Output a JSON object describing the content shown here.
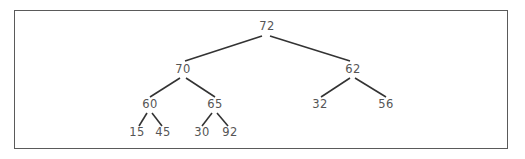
{
  "diagram": {
    "type": "binary-tree",
    "nodes": [
      {
        "id": "n72",
        "label": "72",
        "x": 267,
        "y": 27
      },
      {
        "id": "n70",
        "label": "70",
        "x": 183,
        "y": 70
      },
      {
        "id": "n62",
        "label": "62",
        "x": 353,
        "y": 70
      },
      {
        "id": "n60",
        "label": "60",
        "x": 150,
        "y": 105
      },
      {
        "id": "n65",
        "label": "65",
        "x": 215,
        "y": 105
      },
      {
        "id": "n32",
        "label": "32",
        "x": 320,
        "y": 105
      },
      {
        "id": "n56",
        "label": "56",
        "x": 386,
        "y": 105
      },
      {
        "id": "n15",
        "label": "15",
        "x": 137,
        "y": 133
      },
      {
        "id": "n45",
        "label": "45",
        "x": 163,
        "y": 133
      },
      {
        "id": "n30",
        "label": "30",
        "x": 202,
        "y": 133
      },
      {
        "id": "n92",
        "label": "92",
        "x": 230,
        "y": 133
      }
    ],
    "edges": [
      {
        "from": "72",
        "to": "70",
        "x1": 262,
        "y1": 36,
        "x2": 185,
        "y2": 61
      },
      {
        "from": "72",
        "to": "62",
        "x1": 270,
        "y1": 36,
        "x2": 350,
        "y2": 61
      },
      {
        "from": "70",
        "to": "60",
        "x1": 180,
        "y1": 78,
        "x2": 150,
        "y2": 97
      },
      {
        "from": "70",
        "to": "65",
        "x1": 186,
        "y1": 78,
        "x2": 215,
        "y2": 97
      },
      {
        "from": "62",
        "to": "32",
        "x1": 350,
        "y1": 78,
        "x2": 321,
        "y2": 97
      },
      {
        "from": "62",
        "to": "56",
        "x1": 355,
        "y1": 78,
        "x2": 386,
        "y2": 97
      },
      {
        "from": "60",
        "to": "15",
        "x1": 147,
        "y1": 113,
        "x2": 139,
        "y2": 126
      },
      {
        "from": "60",
        "to": "45",
        "x1": 152,
        "y1": 113,
        "x2": 162,
        "y2": 126
      },
      {
        "from": "65",
        "to": "30",
        "x1": 212,
        "y1": 113,
        "x2": 202,
        "y2": 126
      },
      {
        "from": "65",
        "to": "92",
        "x1": 217,
        "y1": 113,
        "x2": 228,
        "y2": 126
      }
    ]
  }
}
